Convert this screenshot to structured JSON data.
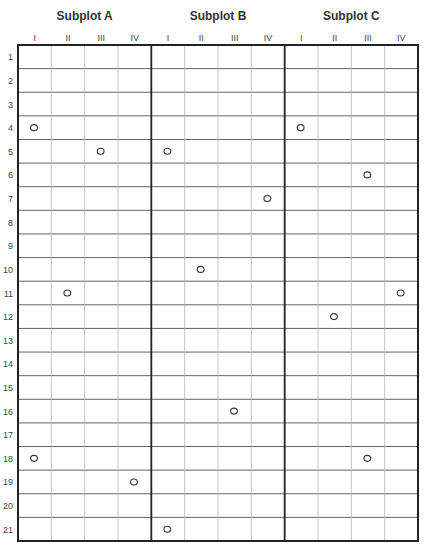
{
  "chart_data": {
    "type": "scatter",
    "title": "",
    "subplots": [
      {
        "name": "Subplot A",
        "columns": [
          "I",
          "II",
          "III",
          "IV"
        ],
        "points": [
          {
            "column": "I",
            "row": 4
          },
          {
            "column": "III",
            "row": 5
          },
          {
            "column": "II",
            "row": 11
          },
          {
            "column": "I",
            "row": 18
          },
          {
            "column": "IV",
            "row": 19
          }
        ]
      },
      {
        "name": "Subplot B",
        "columns": [
          "I",
          "II",
          "III",
          "IV"
        ],
        "points": [
          {
            "column": "I",
            "row": 5
          },
          {
            "column": "IV",
            "row": 7
          },
          {
            "column": "II",
            "row": 10
          },
          {
            "column": "III",
            "row": 16
          },
          {
            "column": "I",
            "row": 21
          }
        ]
      },
      {
        "name": "Subplot C",
        "columns": [
          "I",
          "II",
          "III",
          "IV"
        ],
        "points": [
          {
            "column": "I",
            "row": 4
          },
          {
            "column": "III",
            "row": 6
          },
          {
            "column": "IV",
            "row": 11
          },
          {
            "column": "II",
            "row": 12
          },
          {
            "column": "III",
            "row": 18
          }
        ]
      }
    ],
    "rows": [
      "1",
      "2",
      "3",
      "4",
      "5",
      "6",
      "7",
      "8",
      "9",
      "10",
      "11",
      "12",
      "13",
      "14",
      "15",
      "16",
      "17",
      "18",
      "19",
      "20",
      "21"
    ],
    "marker": "O",
    "grid": true
  }
}
